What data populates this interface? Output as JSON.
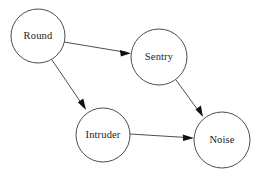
{
  "diagram": {
    "type": "directed-graph",
    "title": "",
    "background_color": "#ffffff",
    "node_stroke_color": "#3a3a3a",
    "node_fill_color": "#ffffff",
    "edge_color": "#3a3a3a",
    "arrowhead_color": "#111111",
    "label_color": "#1a1a1a",
    "nodes": [
      {
        "id": "round",
        "label": "Round",
        "cx": 38,
        "cy": 36,
        "r": 27
      },
      {
        "id": "sentry",
        "label": "Sentry",
        "cx": 159,
        "cy": 57,
        "r": 28
      },
      {
        "id": "intruder",
        "label": "Intruder",
        "cx": 103,
        "cy": 135,
        "r": 27
      },
      {
        "id": "noise",
        "label": "Noise",
        "cx": 222,
        "cy": 140,
        "r": 28
      }
    ],
    "edges": [
      {
        "id": "round-sentry",
        "from": "Round",
        "to": "Sentry",
        "x1": 64,
        "y1": 42,
        "x2": 131,
        "y2": 53
      },
      {
        "id": "round-intruder",
        "from": "Round",
        "to": "Intruder",
        "x1": 52,
        "y1": 60,
        "x2": 86,
        "y2": 110
      },
      {
        "id": "sentry-noise",
        "from": "Sentry",
        "to": "Noise",
        "x1": 176,
        "y1": 80,
        "x2": 203,
        "y2": 117
      },
      {
        "id": "intruder-noise",
        "from": "Intruder",
        "to": "Noise",
        "x1": 130,
        "y1": 134,
        "x2": 194,
        "y2": 138
      }
    ]
  }
}
